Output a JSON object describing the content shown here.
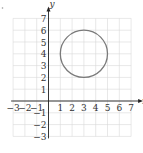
{
  "chart_data": {
    "type": "scatter",
    "title": "",
    "xlabel": "x",
    "ylabel": "y",
    "xlim": [
      -3,
      7
    ],
    "ylim": [
      -3,
      7
    ],
    "grid": true,
    "x_ticks": [
      "-3",
      "-2",
      "-1",
      "1",
      "2",
      "3",
      "4",
      "5",
      "6",
      "7"
    ],
    "y_ticks": [
      "7",
      "6",
      "5",
      "4",
      "3",
      "2",
      "1",
      "-1",
      "-2",
      "-3"
    ],
    "shapes": [
      {
        "kind": "circle",
        "center": [
          3,
          4
        ],
        "radius": 2,
        "stroke": "#7a7a7a"
      }
    ]
  },
  "colors": {
    "grid": "#d9d9d9",
    "axis": "#222222",
    "circle": "#7a7a7a"
  }
}
